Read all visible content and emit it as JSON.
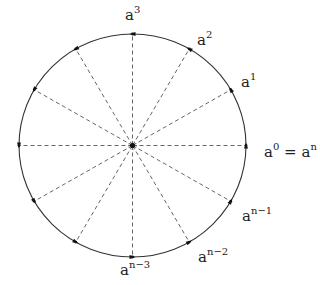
{
  "diagram": {
    "type": "roots-of-unity-circle",
    "center": {
      "x": 132.5,
      "y": 145.5
    },
    "radius_x": 113.5,
    "radius_y": 111.5,
    "num_points": 12,
    "colors": {
      "circle": "#333333",
      "spokes": "#555555",
      "markers": "#111111"
    },
    "labels": [
      {
        "id": "a3",
        "base": "a",
        "exp": "3",
        "angle_deg": 90,
        "x": 125,
        "y": 20
      },
      {
        "id": "a2",
        "base": "a",
        "exp": "2",
        "angle_deg": 60,
        "x": 197,
        "y": 45
      },
      {
        "id": "a1",
        "base": "a",
        "exp": "1",
        "angle_deg": 30,
        "x": 241,
        "y": 87
      },
      {
        "id": "a0",
        "base": "a",
        "exp": "0",
        "suffix": " = a",
        "suffix_exp": "n",
        "angle_deg": 0,
        "x": 264,
        "y": 157
      },
      {
        "id": "an1",
        "base": "a",
        "exp": "n−1",
        "angle_deg": -30,
        "x": 242,
        "y": 221
      },
      {
        "id": "an2",
        "base": "a",
        "exp": "n−2",
        "angle_deg": -60,
        "x": 198,
        "y": 262
      },
      {
        "id": "an3",
        "base": "a",
        "exp": "n−3",
        "angle_deg": -90,
        "x": 120,
        "y": 275
      }
    ]
  }
}
